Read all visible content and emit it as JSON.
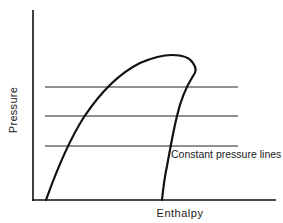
{
  "diagram": {
    "type": "pressure-enthalpy diagram",
    "axes": {
      "x_label": "Enthalpy",
      "y_label": "Pressure"
    },
    "annotation": "Constant pressure lines",
    "constant_pressure_lines": 3,
    "colors": {
      "line": "#111111",
      "background": "#ffffff"
    }
  }
}
